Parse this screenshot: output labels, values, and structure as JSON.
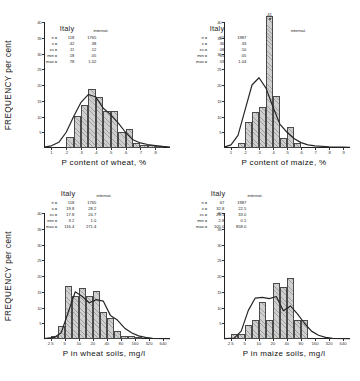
{
  "figure": {
    "yaxis_label": "FREQUENCY  per cent",
    "y_ticks": [
      "40",
      "35",
      "30",
      "25",
      "20",
      "15",
      "10",
      "5"
    ],
    "y_values": [
      40,
      35,
      30,
      25,
      20,
      15,
      10,
      5
    ],
    "ylim": [
      0,
      40
    ],
    "col_header_italy": "Italy",
    "col_header_intl": "internat.",
    "stat_keys": [
      "n =",
      "x =",
      "±s =",
      "min =",
      "max ="
    ]
  },
  "panels": [
    {
      "id": "p-content-wheat",
      "xlabel": "P content of wheat, %",
      "x_ticks": [
        "1",
        ".2",
        ".3",
        ".4",
        ".5",
        ".6",
        ".7",
        ".8"
      ],
      "stats": {
        "italy": {
          "n": "118",
          "mean": ".42",
          "sd": ".11",
          "min": ".18",
          "max": ".78"
        },
        "intl": {
          "n": "1765",
          "mean": ".38",
          "sd": ".12",
          "min": ".05",
          "max": "1.02"
        }
      },
      "chart_data": {
        "type": "bar",
        "title": "P content of wheat, %",
        "xlabel": "P content of wheat, %",
        "ylabel": "FREQUENCY per cent",
        "ylim": [
          0,
          40
        ],
        "xlim": [
          0.05,
          0.9
        ],
        "bin_width": 0.05,
        "categories": [
          ".15",
          ".20",
          ".25",
          ".30",
          ".35",
          ".40",
          ".45",
          ".50",
          ".55",
          ".60",
          ".65",
          ".70",
          ".75",
          ".80"
        ],
        "bin_centers": [
          0.175,
          0.225,
          0.275,
          0.325,
          0.375,
          0.425,
          0.475,
          0.525,
          0.575,
          0.625,
          0.675,
          0.725,
          0.775,
          0.825
        ],
        "values": [
          0,
          3.4,
          10.2,
          13.6,
          18.6,
          16.1,
          11.9,
          11.9,
          5.1,
          5.9,
          1.7,
          0.8,
          0.8,
          0.4
        ],
        "series": [
          {
            "name": "Italy",
            "type": "bar",
            "values": [
              0,
              3.4,
              10.2,
              13.6,
              18.6,
              16.1,
              11.9,
              11.9,
              5.1,
              5.9,
              1.7,
              0.8,
              0.8,
              0.4
            ]
          },
          {
            "name": "internat.",
            "type": "line",
            "x": [
              0.05,
              0.1,
              0.15,
              0.2,
              0.25,
              0.3,
              0.35,
              0.4,
              0.45,
              0.5,
              0.55,
              0.6,
              0.65,
              0.7,
              0.75,
              0.8,
              0.85,
              0.9
            ],
            "values": [
              0.3,
              0.7,
              1.8,
              5.0,
              10.0,
              14.5,
              17.0,
              16.2,
              12.6,
              10.6,
              8.0,
              5.0,
              2.6,
              1.6,
              1.1,
              0.8,
              0.5,
              0.3
            ]
          }
        ]
      }
    },
    {
      "id": "p-content-maize",
      "xlabel": "P content of maize, %",
      "x_ticks": [
        "1",
        ".2",
        ".3",
        ".4",
        ".5",
        ".6",
        ".7",
        ".8",
        ".9"
      ],
      "peak_label": "41",
      "stats": {
        "italy": {
          "n": "61",
          "mean": ".36",
          "sd": ".08",
          "min": ".15",
          "max": ".59"
        },
        "intl": {
          "n": "1987",
          "mean": ".33",
          "sd": ".10",
          "min": ".05",
          "max": "1.04"
        }
      },
      "chart_data": {
        "type": "bar",
        "title": "P content of maize, %",
        "xlabel": "P content of maize, %",
        "ylabel": "FREQUENCY per cent",
        "ylim": [
          0,
          40
        ],
        "ylim_clipped_bar": 41,
        "xlim": [
          0.05,
          0.95
        ],
        "bin_width": 0.05,
        "categories": [
          ".15",
          ".20",
          ".25",
          ".30",
          ".35",
          ".40",
          ".45",
          ".50",
          ".55",
          ".60"
        ],
        "bin_centers": [
          0.175,
          0.225,
          0.275,
          0.325,
          0.375,
          0.425,
          0.475,
          0.525,
          0.575,
          0.625
        ],
        "values": [
          1.6,
          8.2,
          11.5,
          13.1,
          41.0,
          16.4,
          3.3,
          6.6,
          1.6,
          0.0
        ],
        "series": [
          {
            "name": "Italy",
            "type": "bar",
            "values": [
              1.6,
              8.2,
              11.5,
              13.1,
              41.0,
              16.4,
              3.3,
              6.6,
              1.6,
              0.0
            ]
          },
          {
            "name": "internat.",
            "type": "line",
            "x": [
              0.05,
              0.1,
              0.15,
              0.2,
              0.25,
              0.3,
              0.35,
              0.4,
              0.45,
              0.5,
              0.55,
              0.6,
              0.65,
              0.7,
              0.8,
              0.9,
              0.95
            ],
            "values": [
              0.3,
              1.0,
              4.0,
              12.0,
              20.0,
              22.3,
              19.0,
              13.0,
              7.5,
              5.0,
              3.0,
              1.7,
              1.0,
              0.7,
              0.4,
              0.3,
              0.2
            ]
          }
        ]
      }
    },
    {
      "id": "p-wheat-soils",
      "xlabel": "P in wheat soils, mg/l",
      "x_ticks": [
        "2.5",
        "5",
        "10",
        "20",
        "40",
        "80",
        "160",
        "320",
        "640"
      ],
      "x_tick_values": [
        2.5,
        5,
        10,
        20,
        40,
        80,
        160,
        320,
        640
      ],
      "stats": {
        "italy": {
          "n": "118",
          "mean": "19.8",
          "sd": "17.8",
          "min": "3.2",
          "max": "116.4"
        },
        "intl": {
          "n": "1765",
          "mean": "28.2",
          "sd": "24.7",
          "min": "1.0",
          "max": "271.4"
        }
      },
      "chart_data": {
        "type": "bar",
        "title": "P in wheat soils, mg/l",
        "xlabel": "P in wheat soils, mg/l",
        "ylabel": "FREQUENCY per cent",
        "ylim": [
          0,
          40
        ],
        "xscale": "log2",
        "xlim": [
          1.8,
          900
        ],
        "categories": [
          "2.5-3.5",
          "3.5-5",
          "5-7",
          "7-10",
          "10-14",
          "14-20",
          "20-28",
          "28-40",
          "40-57",
          "57-80",
          "80-113",
          "113-160",
          "160-226"
        ],
        "values": [
          0.8,
          4.2,
          16.9,
          13.6,
          16.1,
          13.6,
          15.3,
          8.5,
          6.8,
          2.5,
          0.8,
          0.8,
          0.4
        ],
        "series": [
          {
            "name": "Italy",
            "type": "bar",
            "values": [
              0.8,
              4.2,
              16.9,
              13.6,
              16.1,
              13.6,
              15.3,
              8.5,
              6.8,
              2.5,
              0.8,
              0.8,
              0.4
            ]
          },
          {
            "name": "internat.",
            "type": "line",
            "values": [
              0.5,
              2.0,
              8.5,
              15.0,
              13.5,
              11.5,
              12.5,
              12.0,
              7.5,
              6.0,
              3.5,
              2.0,
              1.0,
              0.5,
              0.2
            ]
          }
        ]
      }
    },
    {
      "id": "p-maize-soils",
      "xlabel": "P in maize soils, mg/l",
      "x_ticks": [
        "2.5",
        "5",
        "10",
        "20",
        "40",
        "80",
        "160",
        "320",
        "640"
      ],
      "x_tick_values": [
        2.5,
        5,
        10,
        20,
        40,
        80,
        160,
        320,
        640
      ],
      "stats": {
        "italy": {
          "n": "67",
          "mean": "32.8",
          "sd": "23.1",
          "min": "2.8",
          "max": "105.0"
        },
        "intl": {
          "n": "1987",
          "mean": "22.5",
          "sd": "33.0",
          "min": "0.1",
          "max": "858.0"
        }
      },
      "chart_data": {
        "type": "bar",
        "title": "P in maize soils, mg/l",
        "xlabel": "P in maize soils, mg/l",
        "ylabel": "FREQUENCY per cent",
        "ylim": [
          0,
          40
        ],
        "xscale": "log2",
        "xlim": [
          1.8,
          900
        ],
        "categories": [
          "2.5-3.5",
          "3.5-5",
          "5-7",
          "7-10",
          "10-14",
          "14-20",
          "20-28",
          "28-40",
          "40-57",
          "57-80",
          "80-113"
        ],
        "values": [
          1.5,
          1.5,
          4.5,
          6.0,
          11.9,
          6.0,
          17.9,
          16.4,
          19.4,
          6.0,
          6.0
        ],
        "series": [
          {
            "name": "Italy",
            "type": "bar",
            "values": [
              1.5,
              1.5,
              4.5,
              6.0,
              11.9,
              6.0,
              17.9,
              16.4,
              19.4,
              6.0,
              6.0
            ]
          },
          {
            "name": "internat.",
            "type": "line",
            "values": [
              0.3,
              2.5,
              9.0,
              13.0,
              13.2,
              12.8,
              13.5,
              9.0,
              10.5,
              8.0,
              5.0,
              2.5,
              1.2,
              0.5,
              0.2
            ]
          }
        ]
      }
    }
  ]
}
